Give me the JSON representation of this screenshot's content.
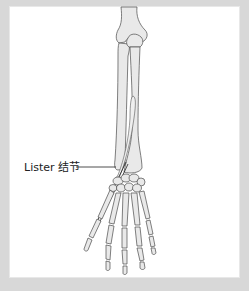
{
  "figure": {
    "annotations": [
      {
        "id": "lister-tubercle",
        "label": "Lister 结节"
      }
    ]
  },
  "colors": {
    "frame": "#d8d8d8",
    "panel": "#ffffff",
    "bone_fill": "#e9e9e9",
    "bone_outline": "#4a4a4a",
    "label_text": "#222222"
  }
}
